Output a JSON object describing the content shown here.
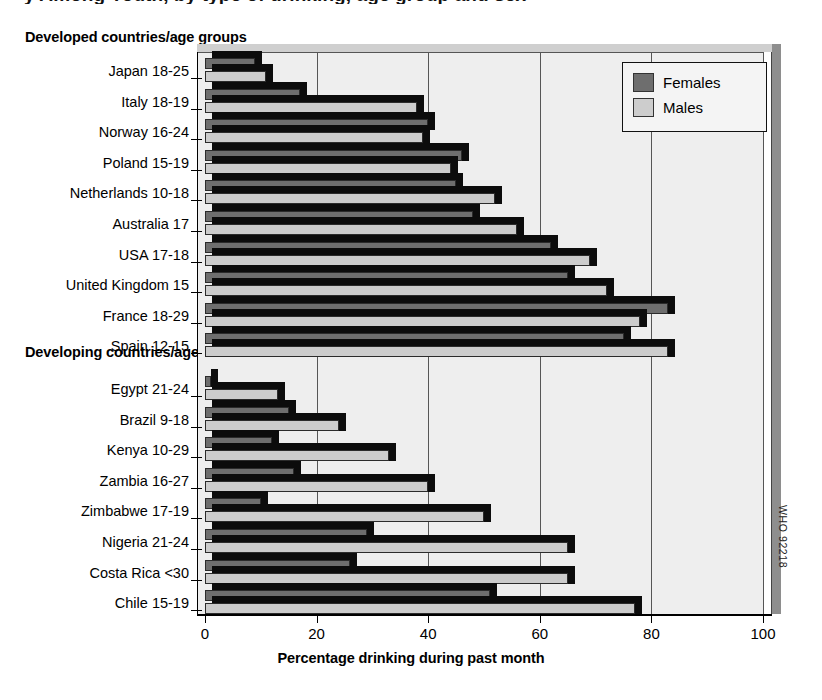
{
  "figure": {
    "clipped_title": "y Among Youth, by type of drinking, age group and sex",
    "group1_heading": "Developed countries/age groups",
    "group2_heading": "Developing countries/age groups",
    "xtitle": "Percentage drinking during past month",
    "source_code": "WHO 92218"
  },
  "legend": {
    "position": "top-right",
    "entries": [
      {
        "label": "Females",
        "color": "#6e6e6e"
      },
      {
        "label": "Males",
        "color": "#cccccc"
      }
    ]
  },
  "axis": {
    "ticks": [
      "0",
      "20",
      "40",
      "60",
      "80",
      "100"
    ],
    "min": 0,
    "max": 100
  },
  "chart_data": {
    "type": "bar",
    "orientation": "horizontal",
    "title": "Percentage drinking during past month",
    "xlabel": "Percentage drinking during past month",
    "ylabel": "",
    "xlim": [
      0,
      100
    ],
    "grid": true,
    "legend_position": "top-right",
    "legend": [
      "Females",
      "Males"
    ],
    "groups": [
      {
        "name": "Developed countries/age groups",
        "categories": [
          "Japan 18-25",
          "Italy 18-19",
          "Norway 16-24",
          "Poland 15-19",
          "Netherlands 10-18",
          "Australia 17",
          "USA 17-18",
          "United Kingdom 15",
          "France 18-29",
          "Spain 12-15"
        ],
        "series": [
          {
            "name": "Females",
            "values": [
              9,
              17,
              40,
              46,
              45,
              48,
              62,
              65,
              83,
              75
            ]
          },
          {
            "name": "Males",
            "values": [
              11,
              38,
              39,
              44,
              52,
              56,
              69,
              72,
              78,
              83
            ]
          }
        ]
      },
      {
        "name": "Developing countries/age groups",
        "categories": [
          "Egypt 21-24",
          "Brazil 9-18",
          "Kenya 10-29",
          "Zambia 16-27",
          "Zimbabwe 17-19",
          "Nigeria 21-24",
          "Costa Rica <30",
          "Chile 15-19"
        ],
        "series": [
          {
            "name": "Females",
            "values": [
              1,
              15,
              12,
              16,
              10,
              29,
              26,
              51
            ]
          },
          {
            "name": "Males",
            "values": [
              13,
              24,
              33,
              40,
              50,
              65,
              65,
              77
            ]
          }
        ]
      }
    ]
  }
}
